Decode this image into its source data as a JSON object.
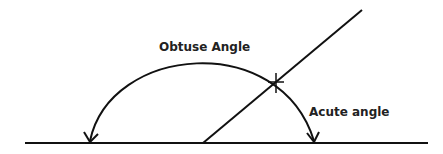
{
  "diagram": {
    "type": "angle-illustration",
    "labels": {
      "obtuse": "Obtuse Angle",
      "acute": "Acute angle"
    },
    "stroke_color": "#111111",
    "background": "#ffffff"
  }
}
